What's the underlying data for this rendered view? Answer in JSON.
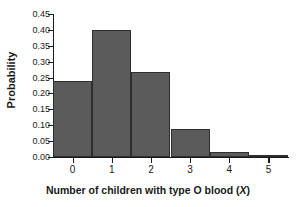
{
  "chart_data": {
    "type": "bar",
    "title": "",
    "xlabel": "Number of children with type O blood (X)",
    "xlabel_text": "Number of children with type O blood (",
    "xlabel_italic_var": "X",
    "xlabel_suffix": ")",
    "ylabel": "Probability",
    "categories": [
      "0",
      "1",
      "2",
      "3",
      "4",
      "5"
    ],
    "values": [
      0.24,
      0.4,
      0.267,
      0.089,
      0.015,
      0.001
    ],
    "ylim": [
      0.0,
      0.45
    ],
    "xlim": [
      -0.5,
      5.5
    ],
    "ytick_labels": [
      "0.45",
      "0.40",
      "0.35",
      "0.30",
      "0.25",
      "0.20",
      "0.15",
      "0.10",
      "0.05",
      "0.00"
    ],
    "ytick_values": [
      0.45,
      0.4,
      0.35,
      0.3,
      0.25,
      0.2,
      0.15,
      0.1,
      0.05,
      0.0
    ],
    "xtick_labels": [
      "0",
      "1",
      "2",
      "3",
      "4",
      "5"
    ],
    "grid": false,
    "legend": false,
    "bar_color": "#5b5b5b",
    "bar_edge_color": "#2e2e2e",
    "axis_color": "#1a1a1a",
    "background_color": "#ffffff",
    "bar_width": 1.0
  }
}
